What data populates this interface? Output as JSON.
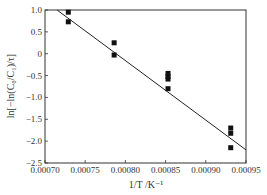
{
  "chart_data": {
    "type": "scatter",
    "title": "",
    "xlabel": "1/T /K⁻¹",
    "ylabel": "ln[−ln(C₀/C₁)/τ]",
    "xlim": [
      0.0007,
      0.00095
    ],
    "ylim": [
      -2.5,
      1.0
    ],
    "grid": false,
    "legend": "none",
    "x_ticks": [
      0.0007,
      0.00075,
      0.0008,
      0.00085,
      0.0009,
      0.00095
    ],
    "x_tick_labels": [
      "0.00070",
      "0.00075",
      "0.00080",
      "0.00085",
      "0.00090",
      "0.00095"
    ],
    "y_ticks": [
      1.0,
      0.5,
      0,
      -0.5,
      -1.0,
      -1.5,
      -2.0,
      -2.5
    ],
    "y_tick_labels": [
      "1.0",
      "0.5",
      "0",
      "−0.5",
      "−1.0",
      "−1.5",
      "−2.0",
      "−2.5"
    ],
    "series": [
      {
        "name": "measured",
        "marker": "square",
        "color": "#111111",
        "points": [
          {
            "x": 0.000729,
            "y": 0.95
          },
          {
            "x": 0.000729,
            "y": 0.73
          },
          {
            "x": 0.000786,
            "y": 0.25
          },
          {
            "x": 0.000786,
            "y": -0.03
          },
          {
            "x": 0.000853,
            "y": -0.45
          },
          {
            "x": 0.000853,
            "y": -0.52
          },
          {
            "x": 0.000853,
            "y": -0.58
          },
          {
            "x": 0.000853,
            "y": -0.8
          },
          {
            "x": 0.000931,
            "y": -1.7
          },
          {
            "x": 0.000931,
            "y": -1.82
          },
          {
            "x": 0.000931,
            "y": -2.15
          }
        ]
      },
      {
        "name": "linear-fit",
        "type": "line",
        "color": "#222222",
        "points": [
          {
            "x": 0.000715,
            "y": 1.0
          },
          {
            "x": 0.00095,
            "y": -2.2
          }
        ]
      }
    ]
  }
}
